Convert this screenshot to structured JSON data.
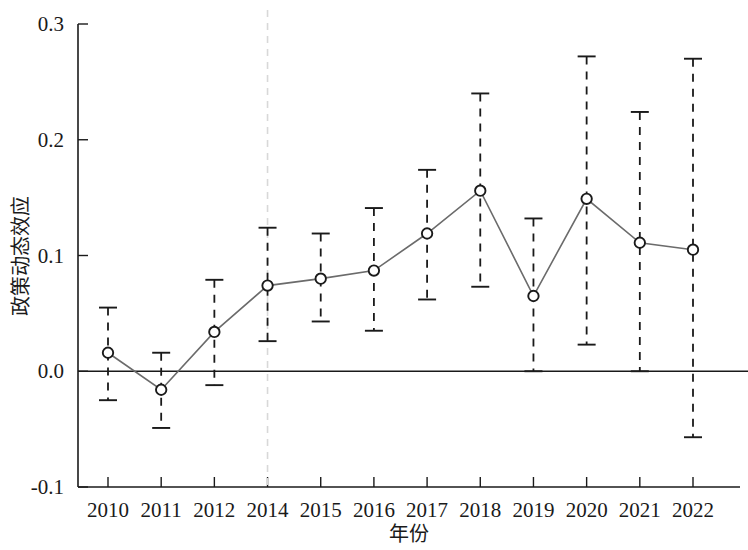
{
  "chart_data": {
    "type": "line",
    "title": "",
    "subtitle": "",
    "xlabel": "年份",
    "ylabel": "政策动态效应",
    "categories": [
      "2010",
      "2011",
      "2012",
      "2014",
      "2015",
      "2016",
      "2017",
      "2018",
      "2019",
      "2020",
      "2021",
      "2022"
    ],
    "values": [
      0.016,
      -0.016,
      0.034,
      0.074,
      0.08,
      0.087,
      0.119,
      0.156,
      0.065,
      0.149,
      0.111,
      0.105
    ],
    "ci_lower": [
      -0.025,
      -0.049,
      -0.012,
      0.026,
      0.043,
      0.035,
      0.062,
      0.073,
      0.0,
      0.023,
      0.0,
      -0.057
    ],
    "ci_upper": [
      0.055,
      0.016,
      0.079,
      0.124,
      0.119,
      0.141,
      0.174,
      0.24,
      0.132,
      0.272,
      0.224,
      0.27
    ],
    "ylim": [
      -0.1,
      0.3
    ],
    "yticks": [
      -0.1,
      0.0,
      0.1,
      0.2,
      0.3
    ],
    "ytick_labels": [
      "-0.1",
      "0.0",
      "0.1",
      "0.2",
      "0.3"
    ],
    "xtick_labels": [
      "2010",
      "2011",
      "2012",
      "2014",
      "2015",
      "2016",
      "2017",
      "2018",
      "2019",
      "2020",
      "2021",
      "2022"
    ],
    "grid": false,
    "legend": "none",
    "zero_line": 0.0,
    "reference_line_x": "2014",
    "error_bar_style": "dashed",
    "marker_style": "open-circle",
    "colors": {
      "line": "#6b6b6b",
      "marker_edge": "#1a1a1a",
      "marker_fill": "#ffffff",
      "error_bar": "#1a1a1a",
      "axis": "#1a1a1a",
      "reference_line": "#d8d8d8",
      "background": "#ffffff"
    },
    "annotations": []
  },
  "labels": {
    "y_axis_title": "政策动态效应",
    "x_axis_title": "年份"
  }
}
